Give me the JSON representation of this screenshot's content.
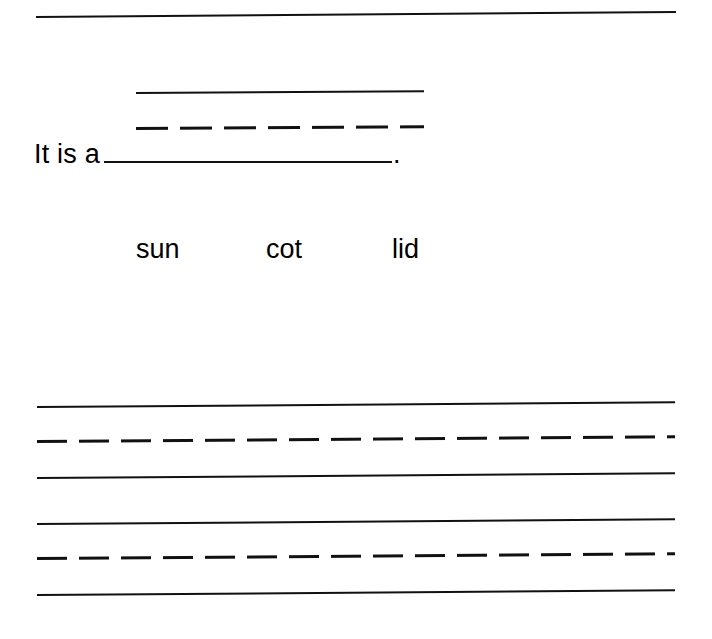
{
  "page": {
    "type": "handwriting-worksheet",
    "background_color": "#ffffff",
    "ink_color": "#111111",
    "width": 712,
    "height": 639
  },
  "top_rule": {
    "name": "header-divider",
    "x": 36,
    "y": 16,
    "width": 640,
    "style": "solid"
  },
  "exercise": {
    "sentence_prefix": "It is a",
    "sentence_period": ".",
    "blank_label": "answer-blank",
    "guide": {
      "top_line_style": "solid",
      "mid_line_style": "dashed",
      "baseline_style": "solid",
      "x": 136,
      "width": 288,
      "top_line_y": 92,
      "mid_line_y": 128,
      "baseline_y": 161
    }
  },
  "word_bank": {
    "label": "word-choices",
    "words": [
      "sun",
      "cot",
      "lid"
    ]
  },
  "practice_lines": {
    "label": "handwriting-practice-area",
    "x": 37,
    "width": 638,
    "groups": [
      {
        "name": "practice-line-group-1",
        "lines": [
          {
            "style": "solid",
            "y": 406
          },
          {
            "style": "dashed",
            "y": 441
          },
          {
            "style": "solid",
            "y": 477
          }
        ]
      },
      {
        "name": "practice-line-group-2",
        "lines": [
          {
            "style": "solid",
            "y": 523
          },
          {
            "style": "dashed",
            "y": 558
          },
          {
            "style": "solid",
            "y": 594
          }
        ]
      }
    ]
  }
}
